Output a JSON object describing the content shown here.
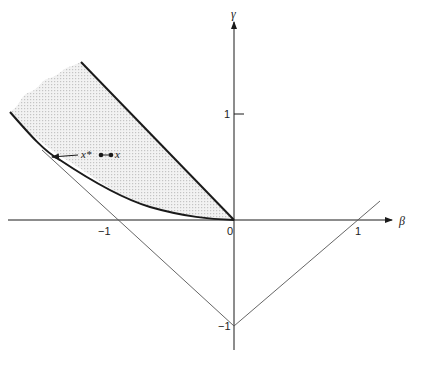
{
  "diagram": {
    "axes": {
      "x_label": "β",
      "y_label": "γ",
      "origin_label": "0",
      "x_ticks": [
        {
          "label": "−1",
          "value": -1
        },
        {
          "label": "1",
          "value": 1
        }
      ],
      "y_ticks": [
        {
          "label": "1",
          "value": 1
        },
        {
          "label": "−1",
          "value": -1
        }
      ]
    },
    "annotations": {
      "x_star": "x*",
      "x": "x"
    },
    "regions": {
      "shaded_region": "feasible cone between line γ = −β·(slope) and curve",
      "shade_color": "#e6e6e6"
    },
    "colors": {
      "ink": "#1a1a1a",
      "thin_line": "#555555"
    }
  }
}
